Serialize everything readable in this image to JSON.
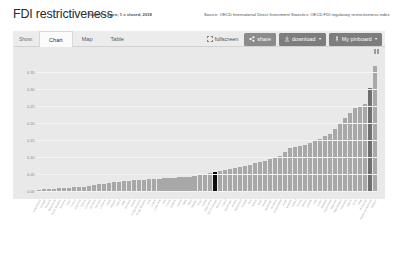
{
  "header": {
    "title": "FDI restrictiveness",
    "subtitle": "Total, 0 = open; 1 = closed, 2018",
    "source": "Source: OECD International Direct Investment Statistics: OECD FDI regulatory restrictiveness index"
  },
  "toolbar": {
    "show_label": "Show:",
    "tabs": [
      {
        "label": "Chart",
        "active": true
      },
      {
        "label": "Map",
        "active": false
      },
      {
        "label": "Table",
        "active": false
      }
    ],
    "buttons": {
      "fullscreen": "fullscreen",
      "share": "share",
      "download": "download",
      "pinboard": "My pinboard",
      "caret": "▾"
    }
  },
  "chart_data": {
    "type": "bar",
    "title": "FDI restrictiveness",
    "subtitle": "Total, 0 = open; 1 = closed, 2018",
    "xlabel": "",
    "ylabel": "",
    "ylim": [
      0,
      0.4
    ],
    "grid": true,
    "legend": "none",
    "yticks": [
      "0.00",
      "0.05",
      "0.10",
      "0.15",
      "0.20",
      "0.25",
      "0.30",
      "0.35"
    ],
    "ytick_values": [
      0.0,
      0.05,
      0.1,
      0.15,
      0.2,
      0.25,
      0.3,
      0.35
    ],
    "highlight_index": 35,
    "highlight_color": "#0d0d0d",
    "secondary_highlight_index": 66,
    "secondary_highlight_color": "#6f6f6f",
    "bar_color": "#a8a8a8",
    "categories": [
      "Luxembourg",
      "Portugal",
      "Slovenia",
      "Netherlands",
      "Czech Republic",
      "Romania",
      "Spain",
      "Finland",
      "Argentina",
      "Estonia",
      "Colombia",
      "Germany",
      "Hungary",
      "Lithuania",
      "Latvia",
      "Belgium",
      "Ireland",
      "Japan",
      "Denmark",
      "Greece",
      "United Kingdom",
      "Slovak Republic",
      "Chile",
      "Croatia",
      "Costa Rica",
      "Italy",
      "France",
      "Bulgaria",
      "Cyprus",
      "Malta",
      "Egypt",
      "Sweden",
      "Brazil",
      "Turkey",
      "South Africa",
      "OECD average",
      "Morocco",
      "Poland",
      "Kazakhstan",
      "Ukraine",
      "Switzerland",
      "Norway",
      "Peru",
      "Austria",
      "Israel",
      "Russia",
      "Kyrgyzstan",
      "Mongolia",
      "United States",
      "Korea",
      "Australia",
      "Iceland",
      "Tunisia",
      "Mexico",
      "Canada",
      "India",
      "Jordan",
      "Malaysia",
      "Saudi Arabia",
      "Myanmar",
      "New Zealand",
      "Indonesia",
      "Algeria",
      "China",
      "Libya",
      "Philippines",
      "Palestinian Authority",
      "Lebanon"
    ],
    "values": [
      0.004,
      0.005,
      0.006,
      0.007,
      0.008,
      0.009,
      0.01,
      0.011,
      0.012,
      0.013,
      0.014,
      0.018,
      0.02,
      0.022,
      0.024,
      0.026,
      0.028,
      0.03,
      0.031,
      0.032,
      0.033,
      0.034,
      0.035,
      0.036,
      0.037,
      0.038,
      0.039,
      0.04,
      0.041,
      0.042,
      0.043,
      0.045,
      0.047,
      0.05,
      0.053,
      0.055,
      0.06,
      0.063,
      0.066,
      0.069,
      0.072,
      0.075,
      0.078,
      0.082,
      0.086,
      0.09,
      0.095,
      0.1,
      0.105,
      0.115,
      0.128,
      0.131,
      0.134,
      0.137,
      0.142,
      0.148,
      0.155,
      0.162,
      0.17,
      0.185,
      0.2,
      0.215,
      0.232,
      0.245,
      0.252,
      0.258,
      0.305,
      0.37
    ]
  }
}
